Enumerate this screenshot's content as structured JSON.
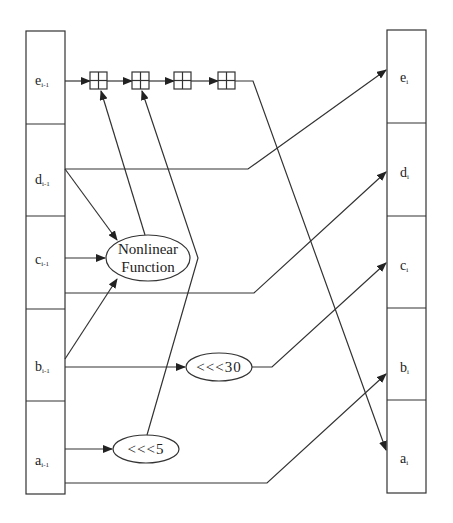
{
  "diagram": {
    "type": "SHA-1 round function dataflow",
    "inputs": [
      {
        "id": "e",
        "main": "e",
        "sub": "i-1"
      },
      {
        "id": "d",
        "main": "d",
        "sub": "i-1"
      },
      {
        "id": "c",
        "main": "c",
        "sub": "i-1"
      },
      {
        "id": "b",
        "main": "b",
        "sub": "i-1"
      },
      {
        "id": "a",
        "main": "a",
        "sub": "i-1"
      }
    ],
    "outputs": [
      {
        "id": "e",
        "main": "e",
        "sub": "i"
      },
      {
        "id": "d",
        "main": "d",
        "sub": "i"
      },
      {
        "id": "c",
        "main": "c",
        "sub": "i"
      },
      {
        "id": "b",
        "main": "b",
        "sub": "i"
      },
      {
        "id": "a",
        "main": "a",
        "sub": "i"
      }
    ],
    "nodes": {
      "nonlinear_line1": "Nonlinear",
      "nonlinear_line2": "Function",
      "rot30": "<<<30",
      "rot5": "<<<5"
    },
    "adders": {
      "count": 4,
      "symbol": "modular-add"
    },
    "edges": [
      {
        "from": "e_{i-1}",
        "to": "adder1"
      },
      {
        "from": "adder1",
        "to": "adder2"
      },
      {
        "from": "adder2",
        "to": "adder3"
      },
      {
        "from": "adder3",
        "to": "adder4"
      },
      {
        "from": "adder4",
        "to": "a_i"
      },
      {
        "from": "d_{i-1}",
        "to": "Nonlinear Function"
      },
      {
        "from": "c_{i-1}",
        "to": "Nonlinear Function"
      },
      {
        "from": "b_{i-1}",
        "to": "Nonlinear Function"
      },
      {
        "from": "Nonlinear Function",
        "to": "adder1"
      },
      {
        "from": "a_{i-1}",
        "to": "<<<5"
      },
      {
        "from": "<<<5",
        "to": "adder2"
      },
      {
        "from": "d_{i-1}",
        "to": "e_i"
      },
      {
        "from": "c_{i-1}",
        "to": "d_i"
      },
      {
        "from": "b_{i-1}",
        "to": "<<<30"
      },
      {
        "from": "<<<30",
        "to": "c_i"
      },
      {
        "from": "a_{i-1}",
        "to": "b_i"
      }
    ]
  }
}
